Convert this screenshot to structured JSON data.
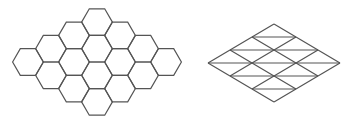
{
  "figure": {
    "stroke_color": "#555555",
    "background": "#ffffff",
    "hex_grid": {
      "label": "hexagonal tiling",
      "rows_per_side": 4,
      "cell_count": 16,
      "side_px": 15.4,
      "origin": [
        28,
        62
      ],
      "step_a": [
        23,
        -13.3
      ],
      "step_b": [
        23,
        13.3
      ]
    },
    "tri_grid": {
      "label": "triangular lattice",
      "divisions": 3,
      "left": [
        208,
        63
      ],
      "top": [
        274,
        24
      ],
      "right": [
        340,
        63
      ],
      "bottom": [
        274,
        102
      ]
    }
  }
}
